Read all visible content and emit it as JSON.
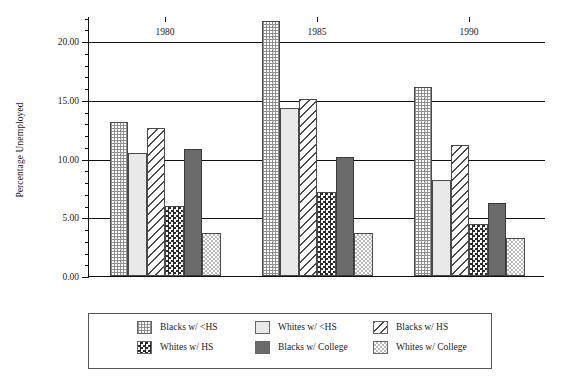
{
  "chart_data": {
    "type": "bar",
    "title": "",
    "subtitle": "",
    "xlabel": "",
    "ylabel": "Percentage Unemployed",
    "categories": [
      "1980",
      "1985",
      "1990"
    ],
    "ylim": [
      0,
      22.15
    ],
    "yticks": [
      0,
      5,
      10,
      15,
      20
    ],
    "ytick_labels": [
      "0.00",
      "5.00",
      "10.00",
      "15.00",
      "20.00"
    ],
    "minor_tick_step": 1,
    "grid": "horizontal-major",
    "legend_position": "bottom",
    "series": [
      {
        "name": "Blacks w/ <HS",
        "pattern": "dots",
        "color": "#8e8e8e",
        "values": [
          13.1,
          21.7,
          16.1
        ]
      },
      {
        "name": "Whites w/ <HS",
        "pattern": "light-solid",
        "color": "#e9e9e9",
        "values": [
          10.5,
          14.3,
          8.2
        ]
      },
      {
        "name": "Blacks w/ HS",
        "pattern": "diagonal-hatch",
        "color": "#4a4a4a",
        "values": [
          12.6,
          15.1,
          11.2
        ]
      },
      {
        "name": "Whites w/ HS",
        "pattern": "checkerboard-dark",
        "color": "#2b2b2b",
        "values": [
          6.0,
          7.2,
          4.4
        ]
      },
      {
        "name": "Blacks w/ College",
        "pattern": "solid-dark",
        "color": "#6b6b6b",
        "values": [
          10.8,
          10.1,
          6.2
        ]
      },
      {
        "name": "Whites w/ College",
        "pattern": "checkerboard-light",
        "color": "#b9b9b9",
        "values": [
          3.7,
          3.7,
          3.2
        ]
      }
    ]
  },
  "legend": {
    "items": [
      "Blacks w/ <HS",
      "Whites w/ <HS",
      "Blacks w/ HS",
      "Whites w/ HS",
      "Blacks w/ College",
      "Whites w/ College"
    ]
  }
}
